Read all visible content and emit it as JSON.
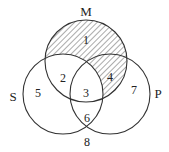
{
  "diagram": {
    "type": "venn-3",
    "stroke_color": "#333333",
    "hatch_color": "#333333",
    "circles": [
      {
        "id": "M",
        "label": "M",
        "cx": 86,
        "cy": 61,
        "r": 41,
        "label_x": 86,
        "label_y": 16
      },
      {
        "id": "S",
        "label": "S",
        "cx": 63,
        "cy": 94,
        "r": 40,
        "label_x": 13,
        "label_y": 101
      },
      {
        "id": "P",
        "label": "P",
        "cx": 110,
        "cy": 94,
        "r": 40,
        "label_x": 158,
        "label_y": 98
      }
    ],
    "regions": [
      {
        "n": "1",
        "x": 86,
        "y": 40,
        "shaded": true
      },
      {
        "n": "2",
        "x": 63,
        "y": 78,
        "shaded": false
      },
      {
        "n": "3",
        "x": 86,
        "y": 93,
        "shaded": false
      },
      {
        "n": "4",
        "x": 110,
        "y": 77,
        "shaded": true
      },
      {
        "n": "5",
        "x": 38,
        "y": 93,
        "shaded": false
      },
      {
        "n": "6",
        "x": 87,
        "y": 118,
        "shaded": false
      },
      {
        "n": "7",
        "x": 134,
        "y": 90,
        "shaded": false
      },
      {
        "n": "8",
        "x": 87,
        "y": 142,
        "shaded": false
      }
    ],
    "shading_description": "M minus S (regions 1 and 4)"
  }
}
